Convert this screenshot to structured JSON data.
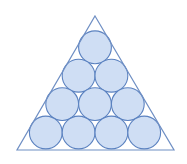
{
  "figure": {
    "name": "circles-packed-in-triangle",
    "canvas": {
      "width": 187,
      "height": 164,
      "background": "#ffffff"
    },
    "colors": {
      "circle_fill": "#cfdef4",
      "circle_stroke": "#5b82c0",
      "triangle_stroke": "#6f8fc4",
      "background": "#ffffff"
    },
    "strokes": {
      "circle_width": 1.1,
      "triangle_width": 1.2
    },
    "triangle": {
      "label": "equilateral-triangle",
      "apex": {
        "x": 95,
        "y": 16
      },
      "bottom_left": {
        "x": 17,
        "y": 150
      },
      "bottom_right": {
        "x": 174,
        "y": 150
      },
      "points": "95,16 174,150 17,150"
    },
    "packing": {
      "arrangement": "triangular",
      "rows": 4,
      "total_circles": 10,
      "radius": 16.4,
      "row_spacing": 28.4,
      "counts_per_row": [
        1,
        2,
        3,
        4
      ]
    },
    "circles": [
      {
        "id": "r1-c1",
        "row": 1,
        "index": 1,
        "cx": 95.0,
        "cy": 47.3,
        "r": 16.4
      },
      {
        "id": "r2-c1",
        "row": 2,
        "index": 1,
        "cx": 78.6,
        "cy": 75.7,
        "r": 16.4
      },
      {
        "id": "r2-c2",
        "row": 2,
        "index": 2,
        "cx": 111.4,
        "cy": 75.7,
        "r": 16.4
      },
      {
        "id": "r3-c1",
        "row": 3,
        "index": 1,
        "cx": 62.2,
        "cy": 104.1,
        "r": 16.4
      },
      {
        "id": "r3-c2",
        "row": 3,
        "index": 2,
        "cx": 95.0,
        "cy": 104.1,
        "r": 16.4
      },
      {
        "id": "r3-c3",
        "row": 3,
        "index": 3,
        "cx": 127.8,
        "cy": 104.1,
        "r": 16.4
      },
      {
        "id": "r4-c1",
        "row": 4,
        "index": 1,
        "cx": 45.8,
        "cy": 132.5,
        "r": 16.4
      },
      {
        "id": "r4-c2",
        "row": 4,
        "index": 2,
        "cx": 78.6,
        "cy": 132.5,
        "r": 16.4
      },
      {
        "id": "r4-c3",
        "row": 4,
        "index": 3,
        "cx": 111.4,
        "cy": 132.5,
        "r": 16.4
      },
      {
        "id": "r4-c4",
        "row": 4,
        "index": 4,
        "cx": 144.2,
        "cy": 132.5,
        "r": 16.4
      }
    ]
  }
}
